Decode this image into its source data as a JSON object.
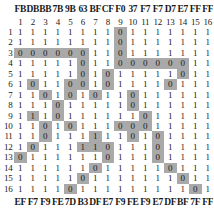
{
  "figure": {
    "name": "binary-matrix-with-hex-codes",
    "rows": 16,
    "cols": 16,
    "shade_color": "#a9a9a9",
    "background_color": "#ffffff",
    "text_color": "#1a1a1a"
  },
  "hex_top": [
    "FB",
    "DB",
    "BB",
    "7B",
    "9B",
    "63",
    "BF",
    "CF",
    "F0",
    "37",
    "F7",
    "F7",
    "D7",
    "E7",
    "FF",
    "FF"
  ],
  "hex_bottom": [
    "EF",
    "F7",
    "F9",
    "FE",
    "7D",
    "B3",
    "DF",
    "E7",
    "F9",
    "FE",
    "F9",
    "E7",
    "DF",
    "BF",
    "7F",
    "FF"
  ],
  "col_labels": [
    "1",
    "2",
    "3",
    "4",
    "5",
    "6",
    "7",
    "8",
    "9",
    "10",
    "11",
    "12",
    "13",
    "14",
    "15",
    "16"
  ],
  "row_labels": [
    "1",
    "2",
    "3",
    "4",
    "5",
    "6",
    "7",
    "8",
    "9",
    "10",
    "11",
    "12",
    "13",
    "14",
    "15",
    "16"
  ],
  "matrix": [
    [
      "1",
      "1",
      "1",
      "1",
      "1",
      "1",
      "1",
      "1",
      "0",
      "1",
      "1",
      "1",
      "1",
      "1",
      "1",
      "1"
    ],
    [
      "1",
      "1",
      "1",
      "1",
      "1",
      "1",
      "1",
      "1",
      "0",
      "1",
      "1",
      "1",
      "1",
      "1",
      "1",
      "1"
    ],
    [
      "0",
      "0",
      "0",
      "0",
      "0",
      "0",
      "1",
      "1",
      "0",
      "1",
      "1",
      "1",
      "1",
      "1",
      "1",
      "1"
    ],
    [
      "1",
      "1",
      "1",
      "1",
      "1",
      "0",
      "1",
      "1",
      "0",
      "0",
      "0",
      "0",
      "0",
      "0",
      "1",
      "1"
    ],
    [
      "1",
      "1",
      "1",
      "1",
      "1",
      "0",
      "1",
      "0",
      "1",
      "1",
      "1",
      "1",
      "1",
      "0",
      "1",
      "1"
    ],
    [
      "1",
      "0",
      "1",
      "1",
      "0",
      "0",
      "1",
      "0",
      "1",
      "1",
      "1",
      "1",
      "0",
      "1",
      "1",
      "1"
    ],
    [
      "1",
      "1",
      "0",
      "1",
      "0",
      "1",
      "0",
      "1",
      "1",
      "0",
      "1",
      "1",
      "1",
      "1",
      "1",
      "1"
    ],
    [
      "1",
      "1",
      "1",
      "0",
      "1",
      "1",
      "1",
      "1",
      "1",
      "0",
      "1",
      "1",
      "1",
      "1",
      "1",
      "1"
    ],
    [
      "1",
      "1",
      "1",
      "0",
      "1",
      "1",
      "1",
      "1",
      "1",
      "1",
      "0",
      "1",
      "1",
      "1",
      "1",
      "1"
    ],
    [
      "1",
      "1",
      "0",
      "1",
      "0",
      "1",
      "1",
      "1",
      "0",
      "0",
      "0",
      "1",
      "1",
      "1",
      "1",
      "1"
    ],
    [
      "1",
      "1",
      "0",
      "1",
      "1",
      "1",
      "1",
      "1",
      "1",
      "0",
      "1",
      "0",
      "1",
      "1",
      "1",
      "1"
    ],
    [
      "1",
      "0",
      "1",
      "1",
      "1",
      "1",
      "1",
      "0",
      "1",
      "1",
      "1",
      "0",
      "1",
      "1",
      "1",
      "1"
    ],
    [
      "0",
      "1",
      "1",
      "1",
      "1",
      "1",
      "1",
      "0",
      "1",
      "1",
      "1",
      "0",
      "1",
      "1",
      "1",
      "1"
    ],
    [
      "1",
      "1",
      "1",
      "1",
      "1",
      "1",
      "0",
      "1",
      "1",
      "1",
      "1",
      "1",
      "0",
      "1",
      "1",
      "1"
    ],
    [
      "1",
      "1",
      "1",
      "1",
      "1",
      "0",
      "1",
      "1",
      "1",
      "1",
      "1",
      "1",
      "1",
      "0",
      "1",
      "1"
    ],
    [
      "1",
      "1",
      "1",
      "1",
      "0",
      "1",
      "1",
      "1",
      "1",
      "1",
      "1",
      "1",
      "1",
      "1",
      "0",
      "1"
    ]
  ],
  "shaded": [
    [
      0,
      0,
      0,
      0,
      0,
      0,
      0,
      0,
      1,
      0,
      0,
      0,
      0,
      0,
      0,
      0
    ],
    [
      0,
      0,
      0,
      0,
      0,
      0,
      0,
      0,
      1,
      0,
      0,
      0,
      0,
      0,
      0,
      0
    ],
    [
      1,
      1,
      1,
      1,
      1,
      1,
      0,
      0,
      1,
      0,
      0,
      0,
      0,
      0,
      0,
      0
    ],
    [
      0,
      0,
      0,
      0,
      0,
      1,
      0,
      0,
      1,
      1,
      1,
      1,
      1,
      1,
      0,
      0
    ],
    [
      0,
      0,
      0,
      0,
      0,
      1,
      0,
      1,
      0,
      0,
      0,
      0,
      0,
      1,
      0,
      0
    ],
    [
      0,
      1,
      0,
      0,
      1,
      1,
      0,
      1,
      0,
      0,
      0,
      0,
      1,
      0,
      0,
      0
    ],
    [
      0,
      0,
      1,
      0,
      1,
      0,
      1,
      0,
      0,
      1,
      0,
      0,
      0,
      0,
      0,
      0
    ],
    [
      0,
      0,
      0,
      1,
      0,
      0,
      0,
      0,
      0,
      1,
      0,
      0,
      0,
      0,
      0,
      0
    ],
    [
      0,
      1,
      0,
      1,
      0,
      0,
      0,
      0,
      0,
      0,
      1,
      0,
      0,
      0,
      0,
      0
    ],
    [
      0,
      0,
      1,
      0,
      1,
      0,
      0,
      0,
      1,
      1,
      1,
      0,
      0,
      0,
      0,
      0
    ],
    [
      0,
      0,
      1,
      0,
      0,
      0,
      1,
      0,
      0,
      1,
      0,
      1,
      0,
      0,
      0,
      0
    ],
    [
      0,
      1,
      0,
      0,
      0,
      1,
      1,
      1,
      0,
      0,
      0,
      1,
      0,
      0,
      0,
      0
    ],
    [
      1,
      0,
      0,
      0,
      0,
      0,
      0,
      1,
      0,
      0,
      0,
      1,
      0,
      0,
      0,
      0
    ],
    [
      0,
      0,
      0,
      0,
      0,
      0,
      1,
      0,
      0,
      0,
      0,
      0,
      1,
      0,
      0,
      0
    ],
    [
      0,
      0,
      0,
      0,
      0,
      1,
      0,
      0,
      0,
      0,
      0,
      0,
      0,
      1,
      0,
      0
    ],
    [
      0,
      0,
      0,
      0,
      1,
      0,
      0,
      0,
      0,
      0,
      0,
      0,
      0,
      0,
      1,
      0
    ]
  ]
}
